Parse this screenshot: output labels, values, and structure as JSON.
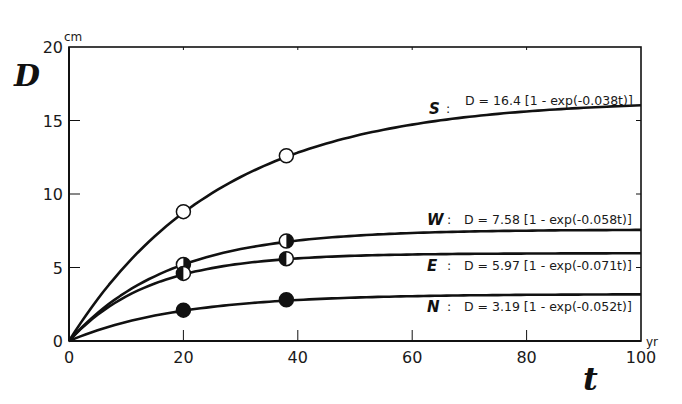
{
  "chart_data": {
    "type": "line",
    "title": "",
    "xlabel": "t",
    "xunit": "yr",
    "ylabel": "D",
    "yunit": "cm",
    "xlim": [
      0,
      100
    ],
    "ylim": [
      0,
      20
    ],
    "xticks": [
      0,
      20,
      40,
      60,
      80,
      100
    ],
    "yticks": [
      0,
      5,
      10,
      15,
      20
    ],
    "grid": false,
    "series": [
      {
        "name": "S",
        "equation": "D = 16.4 [1 - exp(-0.038 t)]",
        "A": 16.4,
        "k": 0.038,
        "marker": "open-circle",
        "points": [
          {
            "t": 20,
            "D": 8.8
          },
          {
            "t": 38,
            "D": 12.6
          }
        ]
      },
      {
        "name": "W",
        "equation": "D = 7.58 [1 - exp(-0.058 t)]",
        "A": 7.58,
        "k": 0.058,
        "marker": "right-half-filled-circle",
        "points": [
          {
            "t": 20,
            "D": 5.2
          },
          {
            "t": 38,
            "D": 6.8
          }
        ]
      },
      {
        "name": "E",
        "equation": "D = 5.97 [1 - exp(-0.071 t)]",
        "A": 5.97,
        "k": 0.071,
        "marker": "left-half-filled-circle",
        "points": [
          {
            "t": 20,
            "D": 4.6
          },
          {
            "t": 38,
            "D": 5.6
          }
        ]
      },
      {
        "name": "N",
        "equation": "D = 3.19 [1 - exp(-0.052 t)]",
        "A": 3.19,
        "k": 0.052,
        "marker": "filled-circle",
        "points": [
          {
            "t": 20,
            "D": 2.1
          },
          {
            "t": 38,
            "D": 2.8
          }
        ]
      }
    ]
  },
  "labels": {
    "y_var": "D",
    "y_unit": "cm",
    "x_var": "t",
    "x_unit": "yr",
    "series_tags": [
      "S",
      "W",
      "E",
      "N"
    ],
    "equations": [
      "D = 16.4 [1 - exp(-0.038t)]",
      "D = 7.58 [1 - exp(-0.058t)]",
      "D = 5.97 [1 - exp(-0.071t)]",
      "D = 3.19 [1 - exp(-0.052t)]"
    ],
    "colon": ":"
  },
  "colors": {
    "ink": "#111111",
    "background": "#ffffff"
  }
}
